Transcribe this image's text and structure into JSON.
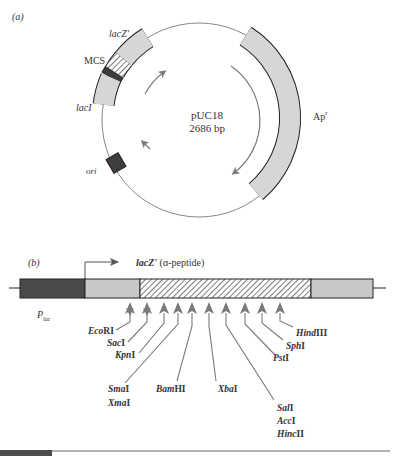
{
  "panel_a": {
    "label": "(a)",
    "plasmid_name": "pUC18",
    "plasmid_size": "2686 bp",
    "features": [
      {
        "name": "lacZ'",
        "label_italic": "lacZ",
        "label_suffix": "'",
        "fill": "#d6d6d6"
      },
      {
        "name": "MCS",
        "label": "MCS",
        "fill": "hatched"
      },
      {
        "name": "lacI",
        "label_italic": "lacI",
        "fill": "#d6d6d6"
      },
      {
        "name": "ori",
        "label_italic": "ori",
        "fill": "#3a3a3a"
      },
      {
        "name": "Ap^r",
        "label": "Ap",
        "label_sup": "r",
        "fill": "#d6d6d6"
      }
    ]
  },
  "panel_b": {
    "label": "(b)",
    "promoter_label": "P",
    "promoter_sub": "lac",
    "gene_label_italic": "lacZ'",
    "gene_label_rest": " (α-peptide)",
    "segments": [
      {
        "name": "Plac",
        "fill": "#4a4a4a"
      },
      {
        "name": "lacZ-start",
        "fill": "#c8c8c8"
      },
      {
        "name": "MCS",
        "fill": "hatched"
      },
      {
        "name": "lacZ-end",
        "fill": "#c8c8c8"
      }
    ],
    "sites": [
      {
        "id": "ecori",
        "it": "Eco",
        "rest": "RI"
      },
      {
        "id": "saci",
        "it": "Sac",
        "rest": "I"
      },
      {
        "id": "kpni",
        "it": "Kpn",
        "rest": "I"
      },
      {
        "id": "smai",
        "it": "Sma",
        "rest": "I"
      },
      {
        "id": "xmai",
        "it": "Xma",
        "rest": "I"
      },
      {
        "id": "bamhi",
        "it": "Bam",
        "rest": "HI"
      },
      {
        "id": "xbai",
        "it": "Xba",
        "rest": "I"
      },
      {
        "id": "sali",
        "it": "Sal",
        "rest": "I"
      },
      {
        "id": "acci",
        "it": "Acc",
        "rest": "I"
      },
      {
        "id": "hincii",
        "it": "Hinc",
        "rest": "II"
      },
      {
        "id": "psti",
        "it": "Pst",
        "rest": "I"
      },
      {
        "id": "sphi",
        "it": "Sph",
        "rest": "I"
      },
      {
        "id": "hindiii",
        "it": "Hind",
        "rest": "III"
      }
    ]
  },
  "colors": {
    "outline": "#222222",
    "light_fill": "#d6d6d6",
    "dark_fill": "#3a3a3a",
    "arrow": "#7a7a7a",
    "footer_bar": "#4d4d4d",
    "footer_line": "#9a9a9a"
  }
}
